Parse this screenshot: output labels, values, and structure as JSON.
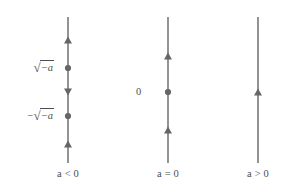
{
  "figure": {
    "stroke_color": "#666666",
    "text_color": "#4d4d4d",
    "background_color": "#ffffff",
    "width": 284,
    "height": 196
  },
  "chart_data": {
    "type": "diagram",
    "subtype": "phase-line",
    "title": "",
    "xlabel": "",
    "ylabel": "",
    "grid": false,
    "legend": null,
    "axis_orientation": "vertical",
    "lines": [
      {
        "id": "line-a-negative",
        "case_label": "a < 0",
        "case_label_var": "a",
        "case_label_rel": "<",
        "case_label_value": "0",
        "x": 68,
        "y_top": 17,
        "y_bottom": 163,
        "equilibria": [
          {
            "label": "√−a",
            "label_kind": "sqrt",
            "negated": false,
            "y": 68,
            "stability": "unstable"
          },
          {
            "label": "−√−a",
            "label_kind": "sqrt",
            "negated": true,
            "y": 116,
            "stability": "stable"
          }
        ],
        "arrows": [
          {
            "y": 40,
            "direction": "up"
          },
          {
            "y": 92,
            "direction": "down"
          },
          {
            "y": 144,
            "direction": "up"
          }
        ]
      },
      {
        "id": "line-a-zero",
        "case_label": "a = 0",
        "case_label_var": "a",
        "case_label_rel": "=",
        "case_label_value": "0",
        "x": 168,
        "y_top": 17,
        "y_bottom": 163,
        "equilibria": [
          {
            "label": "0",
            "label_kind": "plain",
            "negated": false,
            "y": 92,
            "stability": "semi-stable"
          }
        ],
        "arrows": [
          {
            "y": 56,
            "direction": "up"
          },
          {
            "y": 130,
            "direction": "up"
          }
        ]
      },
      {
        "id": "line-a-positive",
        "case_label": "a > 0",
        "case_label_var": "a",
        "case_label_rel": ">",
        "case_label_value": "0",
        "x": 258,
        "y_top": 17,
        "y_bottom": 163,
        "equilibria": [],
        "arrows": [
          {
            "y": 92,
            "direction": "up"
          }
        ]
      }
    ]
  },
  "labels": {
    "sqrt_pos": {
      "prefix": "",
      "sign": "√",
      "radicand": "−a"
    },
    "sqrt_neg": {
      "prefix": "−",
      "sign": "√",
      "radicand": "−a"
    },
    "zero": "0",
    "case_a_negative": "a < 0",
    "case_a_zero": "a = 0",
    "case_a_positive": "a > 0"
  }
}
